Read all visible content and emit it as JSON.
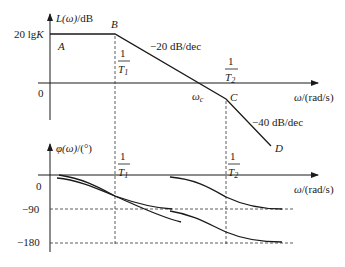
{
  "magnitude_plot": {
    "y_axis_label_fn": "L(ω)",
    "y_axis_label_unit": "/dB",
    "x_axis_label_var": "ω",
    "x_axis_label_unit": "/(rad/s)",
    "level_label_prefix": "20 lg",
    "level_label_var": "K",
    "zero_label": "0",
    "points": {
      "A": "A",
      "B": "B",
      "C": "C",
      "D": "D"
    },
    "crossover_label_var": "ω",
    "crossover_label_sub": "c",
    "slope1_label": "−20 dB/dec",
    "slope2_label": "−40 dB/dec",
    "corner1": {
      "num": "1",
      "den_var": "T",
      "den_sub": "1"
    },
    "corner2": {
      "num": "1",
      "den_var": "T",
      "den_sub": "2"
    }
  },
  "phase_plot": {
    "y_axis_label_fn": "φ(ω)",
    "y_axis_label_unit": "/(°)",
    "x_axis_label_var": "ω",
    "x_axis_label_unit": "/(rad/s)",
    "tick_labels": [
      "0",
      "−90",
      "−180"
    ],
    "corner1": {
      "num": "1",
      "den_var": "T",
      "den_sub": "1"
    },
    "corner2": {
      "num": "1",
      "den_var": "T",
      "den_sub": "2"
    }
  }
}
